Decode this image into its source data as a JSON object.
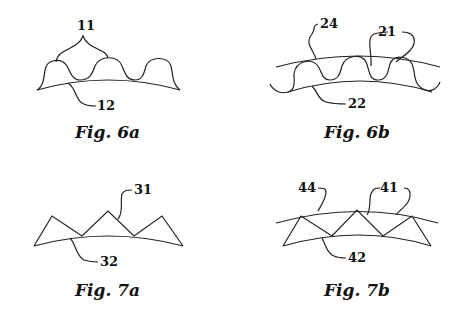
{
  "figures": [
    {
      "id": "fig6a",
      "caption": "Fig. 6a",
      "labels": {
        "a": "11",
        "b": "12"
      }
    },
    {
      "id": "fig6b",
      "caption": "Fig. 6b",
      "labels": {
        "a": "24",
        "b": "21",
        "c": "22"
      }
    },
    {
      "id": "fig7a",
      "caption": "Fig. 7a",
      "labels": {
        "a": "31",
        "b": "32"
      }
    },
    {
      "id": "fig7b",
      "caption": "Fig. 7b",
      "labels": {
        "a": "44",
        "b": "41",
        "c": "42"
      }
    }
  ]
}
